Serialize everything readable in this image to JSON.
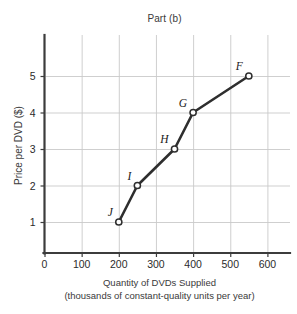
{
  "chart_data": {
    "type": "line",
    "title": "Part (b)",
    "xlabel_line1": "Quantity of DVDs Supplied",
    "xlabel_line2": "(thousands of constant-quality units per year)",
    "ylabel": "Price per DVD ($)",
    "xlim": [
      0,
      650
    ],
    "ylim": [
      0,
      5.85
    ],
    "xticks": [
      0,
      100,
      200,
      300,
      400,
      500,
      600
    ],
    "xtick_labels": [
      "0",
      "100",
      "200",
      "300",
      "400",
      "500",
      "600"
    ],
    "yticks": [
      1,
      2,
      3,
      4,
      5
    ],
    "ytick_labels": [
      "1",
      "2",
      "3",
      "4",
      "5"
    ],
    "grid": true,
    "grid_color": "#c9c9c9",
    "legend": "none",
    "series": [
      {
        "name": "Supply",
        "marker": "open-circle",
        "line_color": "#2e2e2e",
        "marker_face_color": "#ffffff",
        "points": [
          {
            "label": "J",
            "x": 200,
            "y": 1,
            "label_pos": "upper-left"
          },
          {
            "label": "I",
            "x": 250,
            "y": 2,
            "label_pos": "upper-left"
          },
          {
            "label": "H",
            "x": 350,
            "y": 3,
            "label_pos": "upper-left"
          },
          {
            "label": "G",
            "x": 400,
            "y": 4,
            "label_pos": "upper-left"
          },
          {
            "label": "F",
            "x": 550,
            "y": 5,
            "label_pos": "upper-left"
          }
        ]
      }
    ]
  },
  "axes": {
    "axis_color": "#3c3c3c"
  }
}
